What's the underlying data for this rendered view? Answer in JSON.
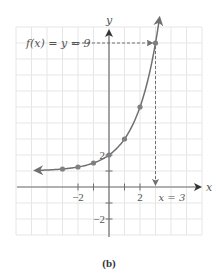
{
  "chart_data": {
    "type": "line",
    "title": "",
    "function_label": "f(x) = y = 9",
    "function": "2^x + 1",
    "xlabel": "x",
    "ylabel": "y",
    "xlim": [
      -6,
      6
    ],
    "ylim": [
      -3,
      10
    ],
    "grid": true,
    "x_ticks": [
      -2,
      -1,
      1,
      2
    ],
    "x_tick_labels": [
      "-2",
      "2"
    ],
    "y_ticks": [
      -2,
      -1,
      1,
      2
    ],
    "y_tick_labels": [
      "-2",
      "2"
    ],
    "series": [
      {
        "name": "f(x)",
        "points": [
          {
            "x": -3,
            "y": 1.125
          },
          {
            "x": -2,
            "y": 1.25
          },
          {
            "x": -1,
            "y": 1.5
          },
          {
            "x": 0,
            "y": 2
          },
          {
            "x": 1,
            "y": 3
          },
          {
            "x": 2,
            "y": 5
          },
          {
            "x": 3,
            "y": 9
          }
        ],
        "curve_x_range": [
          -4.7,
          3.25
        ],
        "left_arrow": true,
        "right_arrow": true
      }
    ],
    "annotations": {
      "highlight_point": {
        "x": 3,
        "y": 9
      },
      "horizontal_label": "f(x) = y = 9",
      "vertical_label": "x = 3"
    },
    "caption": "(b)"
  },
  "colors": {
    "grid": "#e6e6e6",
    "axis": "#6e6e6e",
    "curve": "#707070",
    "point": "#808080",
    "text": "#555555"
  }
}
